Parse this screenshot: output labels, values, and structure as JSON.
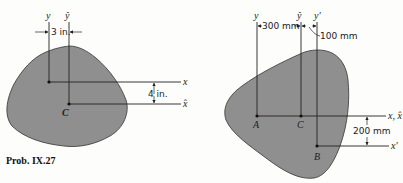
{
  "figure_left": {
    "axes": {
      "y": "y",
      "y_hat": "ŷ",
      "x": "x",
      "x_hat": "x̂"
    },
    "points": {
      "centroid": "C"
    },
    "dimensions": {
      "horizontal": "3 in.",
      "vertical": "4 in."
    },
    "caption": "Prob. IX.27"
  },
  "figure_right": {
    "axes": {
      "y": "y",
      "y_hat": "ŷ",
      "y_prime": "y′",
      "x_combined": "x, x̂",
      "x_prime": "x′"
    },
    "points": {
      "a": "A",
      "centroid": "C",
      "b": "B"
    },
    "dimensions": {
      "horizontal_1": "300 mm",
      "horizontal_2": "100 mm",
      "vertical": "200 mm"
    }
  },
  "colors": {
    "shape_fill": "#8f8f8f",
    "line": "#222222",
    "background": "#fdfdfb"
  }
}
